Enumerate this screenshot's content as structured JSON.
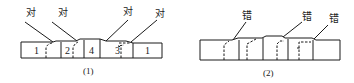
{
  "figure": {
    "panels": [
      {
        "id": "1",
        "caption": "(1)",
        "callout_label": "对",
        "callouts": [
          "对",
          "对",
          "对",
          "对"
        ],
        "block_numbers": [
          "1",
          "2",
          "4",
          "3",
          "1"
        ]
      },
      {
        "id": "2",
        "caption": "(2)",
        "callout_label": "错",
        "callouts": [
          "错",
          "错",
          "错"
        ],
        "block_numbers": []
      }
    ]
  },
  "colors": {
    "stroke": "#1a1a1a",
    "background": "#ffffff"
  }
}
